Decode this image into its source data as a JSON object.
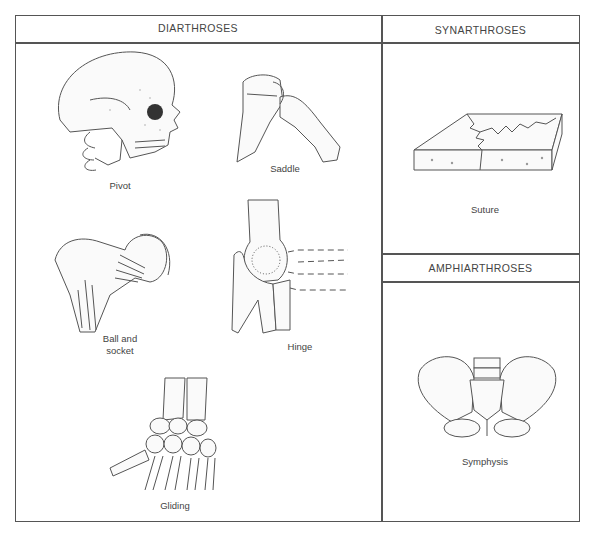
{
  "diagram": {
    "type": "joint-classification-table",
    "columns": [
      {
        "header": "DIARTHROSES",
        "items": [
          {
            "label": "Pivot",
            "icon": "skull-neck-illustration"
          },
          {
            "label": "Saddle",
            "icon": "thumb-saddle-joint-illustration"
          },
          {
            "label_line1": "Ball and",
            "label_line2": "socket",
            "icon": "hip-femur-illustration"
          },
          {
            "label": "Hinge",
            "icon": "elbow-hinge-illustration"
          },
          {
            "label": "Gliding",
            "icon": "wrist-carpals-illustration"
          }
        ]
      },
      {
        "sections": [
          {
            "header": "SYNARTHROSES",
            "items": [
              {
                "label": "Suture",
                "icon": "suture-block-illustration"
              }
            ]
          },
          {
            "header": "AMPHIARTHROSES",
            "items": [
              {
                "label": "Symphysis",
                "icon": "pelvis-illustration"
              }
            ]
          }
        ]
      }
    ],
    "colors": {
      "line": "#555555",
      "text": "#444444",
      "background": "#ffffff"
    }
  }
}
